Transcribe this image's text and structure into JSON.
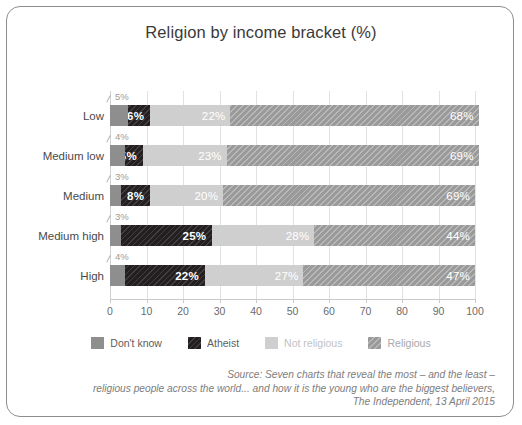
{
  "chart_data": {
    "type": "bar",
    "orientation": "horizontal",
    "stacked": true,
    "title": "Religion by income bracket (%)",
    "xlabel": "",
    "ylabel": "",
    "xlim": [
      0,
      100
    ],
    "xticks": [
      "0",
      "10",
      "20",
      "30",
      "40",
      "50",
      "60",
      "70",
      "80",
      "90",
      "100"
    ],
    "grid": true,
    "legend_position": "bottom",
    "categories": [
      "Low",
      "Medium low",
      "Medium",
      "Medium high",
      "High"
    ],
    "series": [
      {
        "name": "Don't know",
        "color": "#8e8e8e",
        "values": [
          5,
          4,
          3,
          3,
          4
        ]
      },
      {
        "name": "Atheist",
        "color": "#231f20",
        "values": [
          6,
          5,
          8,
          25,
          22
        ]
      },
      {
        "name": "Not religious",
        "color": "#cfcfcf",
        "values": [
          22,
          23,
          20,
          28,
          27
        ]
      },
      {
        "name": "Religious",
        "color": "#9a9a9a",
        "values": [
          68,
          69,
          69,
          44,
          47
        ]
      }
    ],
    "value_labels": {
      "Don't know": [
        "5%",
        "4%",
        "3%",
        "3%",
        "4%"
      ],
      "Atheist": [
        "6%",
        "5%",
        "8%",
        "25%",
        "22%"
      ],
      "Not religious": [
        "22%",
        "23%",
        "20%",
        "28%",
        "27%"
      ],
      "Religious": [
        "68%",
        "69%",
        "69%",
        "44%",
        "47%"
      ]
    },
    "annotations": [
      "Source: Seven charts that reveal the most – and the least –",
      "religious people across the world... and how it is the young who are the biggest believers,",
      "The Independent, 13 April 2015"
    ]
  },
  "source": {
    "line1_lead": "Source:",
    "line1_rest": " Seven charts that reveal the most – and the least –",
    "line2": "religious people across the world... and how it is the young who are the biggest believers,",
    "line3": "The Independent, 13 April 2015"
  }
}
